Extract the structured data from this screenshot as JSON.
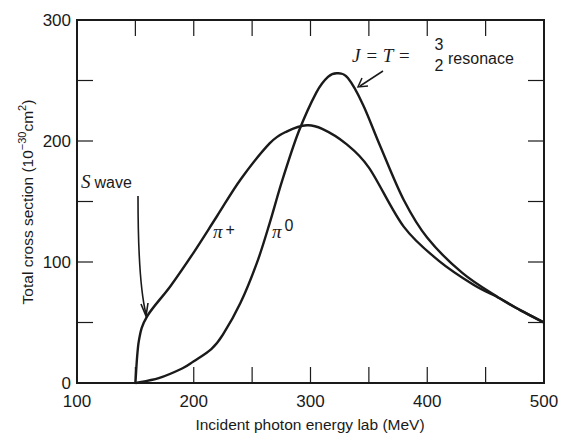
{
  "chart_data": {
    "type": "line",
    "title": "",
    "xlabel": "Incident photon energy lab (MeV)",
    "ylabel": "Total cross section (10^-30 cm^2)",
    "ylabel_parts": {
      "main": "Total cross section (10",
      "exp": "−30",
      "unit": "cm",
      "unit_exp": "2",
      "close": ")"
    },
    "xlim": [
      100,
      500
    ],
    "ylim": [
      0,
      300
    ],
    "x_ticks": [
      100,
      200,
      300,
      400,
      500
    ],
    "x_tick_labels": [
      "100",
      "200",
      "300",
      "400",
      "500"
    ],
    "x_minor_ticks": [
      150,
      250,
      350,
      450
    ],
    "y_ticks": [
      0,
      100,
      200,
      300
    ],
    "y_tick_labels": [
      "0",
      "100",
      "200",
      "300"
    ],
    "y_minor_ticks": [
      50,
      150,
      250
    ],
    "grid": false,
    "legend": null,
    "series": [
      {
        "name": "π+",
        "x": [
          150,
          153,
          160,
          180,
          200,
          220,
          240,
          265,
          280,
          297,
          310,
          330,
          350,
          380,
          410,
          440,
          462,
          480,
          500
        ],
        "y": [
          0,
          35,
          55,
          80,
          108,
          138,
          168,
          198,
          208,
          213,
          210,
          198,
          178,
          129,
          101,
          81,
          70,
          60,
          50
        ]
      },
      {
        "name": "π0",
        "x": [
          150,
          170,
          190,
          200,
          215,
          225,
          240,
          254,
          265,
          276,
          290,
          305,
          315,
          323,
          332,
          345,
          360,
          380,
          400,
          430,
          462,
          480,
          500
        ],
        "y": [
          0,
          4,
          12,
          18,
          28,
          40,
          66,
          99,
          132,
          168,
          208,
          240,
          253,
          256,
          252,
          230,
          195,
          151,
          120,
          91,
          70,
          60,
          50
        ]
      }
    ],
    "annotations": [
      {
        "text": "S wave",
        "italic_part": "S",
        "rest": "wave",
        "points_to": {
          "x": 160,
          "y": 55
        }
      },
      {
        "text": "π+",
        "symbol": "π",
        "sup": "+"
      },
      {
        "text": "π0",
        "symbol": "π",
        "sup": "0"
      },
      {
        "text": "J = T = 3/2 resonace",
        "lhs": "J = T = ",
        "num": "3",
        "den": "2",
        "word": "resonace",
        "points_to": {
          "x": 335,
          "y": 245
        }
      }
    ]
  }
}
